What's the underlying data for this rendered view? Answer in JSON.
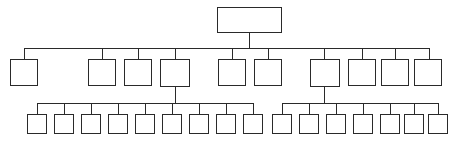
{
  "diagram": {
    "type": "hierarchical-tree",
    "style": {
      "background": "#ffffff",
      "node_fill": "#ffffff",
      "node_stroke": "#2a2a2a",
      "connector_stroke": "#2a2a2a",
      "node_border_width": "1.4px",
      "connector_width": "1.4px"
    },
    "levels": [
      {
        "name": "level-1-root",
        "node_count": 1
      },
      {
        "name": "level-2-divisions",
        "node_count": 10
      },
      {
        "name": "level-3-units",
        "node_count": 16
      }
    ],
    "nodes": {
      "root": [
        {
          "id": "n0",
          "label": "",
          "x": 217,
          "y": 7,
          "w": 65,
          "h": 26
        }
      ],
      "level2": [
        {
          "id": "n1",
          "label": "",
          "x": 10,
          "y": 59,
          "w": 28,
          "h": 27
        },
        {
          "id": "n2",
          "label": "",
          "x": 88,
          "y": 59,
          "w": 28,
          "h": 27
        },
        {
          "id": "n3",
          "label": "",
          "x": 124,
          "y": 59,
          "w": 28,
          "h": 27
        },
        {
          "id": "n4",
          "label": "",
          "x": 160,
          "y": 59,
          "w": 30,
          "h": 28
        },
        {
          "id": "n5",
          "label": "",
          "x": 218,
          "y": 59,
          "w": 28,
          "h": 27
        },
        {
          "id": "n6",
          "label": "",
          "x": 254,
          "y": 59,
          "w": 28,
          "h": 27
        },
        {
          "id": "n7",
          "label": "",
          "x": 310,
          "y": 59,
          "w": 30,
          "h": 28
        },
        {
          "id": "n8",
          "label": "",
          "x": 348,
          "y": 59,
          "w": 28,
          "h": 27
        },
        {
          "id": "n9",
          "label": "",
          "x": 381,
          "y": 59,
          "w": 28,
          "h": 27
        },
        {
          "id": "n10",
          "label": "",
          "x": 414,
          "y": 59,
          "w": 28,
          "h": 27
        }
      ],
      "level3": [
        {
          "id": "m1",
          "label": "",
          "x": 27,
          "y": 114,
          "w": 20,
          "h": 20
        },
        {
          "id": "m2",
          "label": "",
          "x": 54,
          "y": 114,
          "w": 20,
          "h": 20
        },
        {
          "id": "m3",
          "label": "",
          "x": 81,
          "y": 114,
          "w": 20,
          "h": 20
        },
        {
          "id": "m4",
          "label": "",
          "x": 108,
          "y": 114,
          "w": 20,
          "h": 20
        },
        {
          "id": "m5",
          "label": "",
          "x": 135,
          "y": 114,
          "w": 20,
          "h": 20
        },
        {
          "id": "m6",
          "label": "",
          "x": 162,
          "y": 114,
          "w": 20,
          "h": 20
        },
        {
          "id": "m7",
          "label": "",
          "x": 189,
          "y": 114,
          "w": 20,
          "h": 20
        },
        {
          "id": "m8",
          "label": "",
          "x": 216,
          "y": 114,
          "w": 20,
          "h": 20
        },
        {
          "id": "m9",
          "label": "",
          "x": 243,
          "y": 114,
          "w": 20,
          "h": 20
        },
        {
          "id": "m10",
          "label": "",
          "x": 272,
          "y": 114,
          "w": 20,
          "h": 20
        },
        {
          "id": "m11",
          "label": "",
          "x": 299,
          "y": 114,
          "w": 20,
          "h": 20
        },
        {
          "id": "m12",
          "label": "",
          "x": 326,
          "y": 114,
          "w": 20,
          "h": 20
        },
        {
          "id": "m13",
          "label": "",
          "x": 353,
          "y": 114,
          "w": 20,
          "h": 20
        },
        {
          "id": "m14",
          "label": "",
          "x": 380,
          "y": 114,
          "w": 20,
          "h": 20
        },
        {
          "id": "m15",
          "label": "",
          "x": 404,
          "y": 114,
          "w": 20,
          "h": 20
        },
        {
          "id": "m16",
          "label": "",
          "x": 428,
          "y": 114,
          "w": 20,
          "h": 20
        }
      ]
    },
    "connectors": [
      {
        "id": "c-root-stem",
        "kind": "v",
        "x": 249,
        "y": 33,
        "len": 15
      },
      {
        "id": "c-level2-bus",
        "kind": "h",
        "x": 24,
        "y": 48,
        "len": 406
      },
      {
        "id": "c-drop-n1",
        "kind": "v",
        "x": 24,
        "y": 48,
        "len": 11
      },
      {
        "id": "c-drop-n2",
        "kind": "v",
        "x": 102,
        "y": 48,
        "len": 11
      },
      {
        "id": "c-drop-n3",
        "kind": "v",
        "x": 138,
        "y": 48,
        "len": 11
      },
      {
        "id": "c-drop-n4",
        "kind": "v",
        "x": 175,
        "y": 48,
        "len": 11
      },
      {
        "id": "c-drop-n5",
        "kind": "v",
        "x": 232,
        "y": 48,
        "len": 11
      },
      {
        "id": "c-drop-n6",
        "kind": "v",
        "x": 268,
        "y": 48,
        "len": 11
      },
      {
        "id": "c-drop-n7",
        "kind": "v",
        "x": 324,
        "y": 48,
        "len": 11
      },
      {
        "id": "c-drop-n8",
        "kind": "v",
        "x": 362,
        "y": 48,
        "len": 11
      },
      {
        "id": "c-drop-n9",
        "kind": "v",
        "x": 395,
        "y": 48,
        "len": 11
      },
      {
        "id": "c-drop-n10",
        "kind": "v",
        "x": 429,
        "y": 48,
        "len": 11
      },
      {
        "id": "c-stem-n4",
        "kind": "v",
        "x": 175,
        "y": 87,
        "len": 16
      },
      {
        "id": "c-stem-n7",
        "kind": "v",
        "x": 324,
        "y": 87,
        "len": 16
      },
      {
        "id": "c-level3-bus-a",
        "kind": "h",
        "x": 37,
        "y": 103,
        "len": 216
      },
      {
        "id": "c-level3-bus-b",
        "kind": "h",
        "x": 282,
        "y": 103,
        "len": 156
      },
      {
        "id": "c-drop-m1",
        "kind": "v",
        "x": 37,
        "y": 103,
        "len": 11
      },
      {
        "id": "c-drop-m2",
        "kind": "v",
        "x": 64,
        "y": 103,
        "len": 11
      },
      {
        "id": "c-drop-m3",
        "kind": "v",
        "x": 91,
        "y": 103,
        "len": 11
      },
      {
        "id": "c-drop-m4",
        "kind": "v",
        "x": 118,
        "y": 103,
        "len": 11
      },
      {
        "id": "c-drop-m5",
        "kind": "v",
        "x": 145,
        "y": 103,
        "len": 11
      },
      {
        "id": "c-drop-m6",
        "kind": "v",
        "x": 172,
        "y": 103,
        "len": 11
      },
      {
        "id": "c-drop-m7",
        "kind": "v",
        "x": 199,
        "y": 103,
        "len": 11
      },
      {
        "id": "c-drop-m8",
        "kind": "v",
        "x": 226,
        "y": 103,
        "len": 11
      },
      {
        "id": "c-drop-m9",
        "kind": "v",
        "x": 253,
        "y": 103,
        "len": 11
      },
      {
        "id": "c-drop-m10",
        "kind": "v",
        "x": 282,
        "y": 103,
        "len": 11
      },
      {
        "id": "c-drop-m11",
        "kind": "v",
        "x": 309,
        "y": 103,
        "len": 11
      },
      {
        "id": "c-drop-m12",
        "kind": "v",
        "x": 336,
        "y": 103,
        "len": 11
      },
      {
        "id": "c-drop-m13",
        "kind": "v",
        "x": 363,
        "y": 103,
        "len": 11
      },
      {
        "id": "c-drop-m14",
        "kind": "v",
        "x": 390,
        "y": 103,
        "len": 11
      },
      {
        "id": "c-drop-m15",
        "kind": "v",
        "x": 414,
        "y": 103,
        "len": 11
      },
      {
        "id": "c-drop-m16",
        "kind": "v",
        "x": 438,
        "y": 103,
        "len": 11
      }
    ]
  }
}
